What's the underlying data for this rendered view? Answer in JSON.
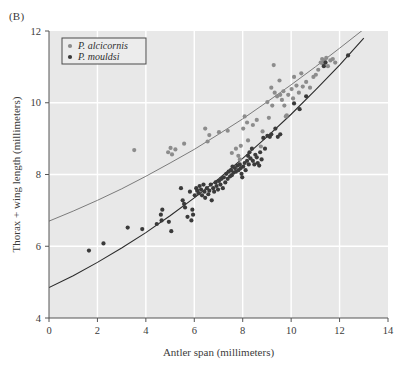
{
  "panel": {
    "label": "(B)"
  },
  "colors": {
    "plot_background": "#e8e8e8",
    "gridline": "#ffffff",
    "axis": "#555555",
    "alcicornis_point": "#8c8c8c",
    "mouldsi_point": "#3a3a3a",
    "alcicornis_curve": "#6e6e6e",
    "mouldsi_curve": "#2b2b2b",
    "legend_background": "#ececec",
    "legend_border": "#4a4a4a",
    "text": "#3b3b3b"
  },
  "legend": {
    "position": "top-left",
    "entries": [
      {
        "label": "P. alcicornis",
        "marker": "dot",
        "color": "#8c8c8c"
      },
      {
        "label": "P. mouldsi",
        "marker": "dot",
        "color": "#3a3a3a"
      }
    ]
  },
  "chart_data": {
    "type": "scatter",
    "title": "",
    "xlabel": "Antler span (millimeters)",
    "ylabel": "Thorax + wing length (millimeters)",
    "xlim": [
      0,
      14
    ],
    "ylim": [
      4,
      12
    ],
    "xticks": [
      0,
      2,
      4,
      6,
      8,
      10,
      12,
      14
    ],
    "yticks": [
      4,
      6,
      8,
      10,
      12
    ],
    "xtick_labels": [
      "0",
      "2",
      "4",
      "6",
      "8",
      "10",
      "12",
      "14"
    ],
    "ytick_labels": [
      "4",
      "6",
      "8",
      "10",
      "12"
    ],
    "grid": true,
    "grid_color": "#ffffff",
    "legend_position": "upper left",
    "series": [
      {
        "name": "P. alcicornis",
        "color": "#8c8c8c",
        "marker": "circle",
        "points": [
          [
            3.52,
            8.68
          ],
          [
            4.92,
            8.62
          ],
          [
            5.02,
            8.74
          ],
          [
            5.08,
            8.56
          ],
          [
            5.22,
            8.7
          ],
          [
            5.58,
            8.86
          ],
          [
            6.45,
            9.28
          ],
          [
            6.55,
            8.92
          ],
          [
            6.62,
            9.1
          ],
          [
            7.02,
            9.18
          ],
          [
            7.38,
            9.22
          ],
          [
            7.55,
            8.6
          ],
          [
            7.72,
            8.72
          ],
          [
            7.82,
            8.52
          ],
          [
            7.88,
            8.42
          ],
          [
            7.92,
            8.8
          ],
          [
            8.02,
            9.28
          ],
          [
            8.08,
            9.62
          ],
          [
            8.18,
            9.45
          ],
          [
            8.22,
            8.95
          ],
          [
            8.42,
            9.38
          ],
          [
            8.58,
            9.52
          ],
          [
            8.75,
            8.78
          ],
          [
            8.82,
            9.2
          ],
          [
            9.02,
            10.02
          ],
          [
            9.08,
            9.58
          ],
          [
            9.18,
            10.42
          ],
          [
            9.22,
            9.92
          ],
          [
            9.28,
            11.05
          ],
          [
            9.32,
            10.28
          ],
          [
            9.42,
            10.18
          ],
          [
            9.52,
            10.62
          ],
          [
            9.55,
            10.22
          ],
          [
            9.62,
            10.08
          ],
          [
            9.68,
            10.32
          ],
          [
            9.72,
            9.92
          ],
          [
            9.78,
            9.62
          ],
          [
            9.82,
            9.65
          ],
          [
            9.88,
            10.22
          ],
          [
            10.02,
            10.38
          ],
          [
            10.08,
            10.12
          ],
          [
            10.12,
            10.72
          ],
          [
            10.22,
            10.48
          ],
          [
            10.32,
            10.28
          ],
          [
            10.42,
            10.82
          ],
          [
            10.48,
            10.45
          ],
          [
            10.62,
            10.58
          ],
          [
            10.78,
            10.42
          ],
          [
            10.92,
            10.72
          ],
          [
            11.02,
            10.78
          ],
          [
            11.12,
            10.92
          ],
          [
            11.22,
            11.12
          ],
          [
            11.28,
            11.22
          ],
          [
            11.32,
            11.08
          ],
          [
            11.38,
            11.18
          ],
          [
            11.45,
            11.25
          ],
          [
            11.52,
            11.02
          ],
          [
            11.62,
            11.18
          ],
          [
            11.72,
            11.22
          ],
          [
            11.82,
            11.12
          ]
        ]
      },
      {
        "name": "P. mouldsi",
        "color": "#3a3a3a",
        "marker": "circle",
        "points": [
          [
            1.65,
            5.88
          ],
          [
            2.25,
            6.08
          ],
          [
            3.25,
            6.52
          ],
          [
            3.85,
            6.48
          ],
          [
            4.45,
            6.62
          ],
          [
            4.62,
            6.88
          ],
          [
            4.65,
            6.72
          ],
          [
            4.68,
            7.02
          ],
          [
            4.95,
            6.68
          ],
          [
            5.05,
            6.42
          ],
          [
            5.45,
            7.62
          ],
          [
            5.52,
            7.28
          ],
          [
            5.58,
            7.18
          ],
          [
            5.62,
            7.08
          ],
          [
            5.72,
            6.82
          ],
          [
            5.82,
            7.52
          ],
          [
            5.88,
            6.72
          ],
          [
            5.92,
            7.02
          ],
          [
            5.95,
            6.88
          ],
          [
            6.02,
            7.42
          ],
          [
            6.08,
            7.62
          ],
          [
            6.12,
            7.55
          ],
          [
            6.18,
            7.48
          ],
          [
            6.22,
            7.68
          ],
          [
            6.28,
            7.58
          ],
          [
            6.32,
            7.42
          ],
          [
            6.38,
            7.72
          ],
          [
            6.42,
            7.52
          ],
          [
            6.45,
            7.35
          ],
          [
            6.52,
            7.62
          ],
          [
            6.58,
            7.45
          ],
          [
            6.62,
            7.55
          ],
          [
            6.68,
            7.72
          ],
          [
            6.72,
            7.28
          ],
          [
            6.78,
            7.62
          ],
          [
            6.82,
            7.52
          ],
          [
            6.88,
            7.78
          ],
          [
            6.92,
            7.68
          ],
          [
            6.98,
            7.58
          ],
          [
            7.02,
            7.82
          ],
          [
            7.08,
            7.72
          ],
          [
            7.12,
            7.88
          ],
          [
            7.18,
            7.62
          ],
          [
            7.22,
            7.92
          ],
          [
            7.28,
            7.78
          ],
          [
            7.32,
            8.02
          ],
          [
            7.38,
            7.88
          ],
          [
            7.42,
            8.08
          ],
          [
            7.48,
            7.95
          ],
          [
            7.52,
            8.12
          ],
          [
            7.55,
            7.98
          ],
          [
            7.58,
            8.22
          ],
          [
            7.62,
            8.05
          ],
          [
            7.68,
            8.18
          ],
          [
            7.72,
            8.08
          ],
          [
            7.78,
            8.25
          ],
          [
            7.82,
            8.12
          ],
          [
            7.88,
            8.28
          ],
          [
            7.92,
            8.18
          ],
          [
            7.95,
            8.02
          ],
          [
            7.98,
            7.92
          ],
          [
            8.02,
            8.22
          ],
          [
            8.08,
            8.32
          ],
          [
            8.12,
            8.12
          ],
          [
            8.18,
            8.38
          ],
          [
            8.22,
            8.52
          ],
          [
            8.25,
            8.28
          ],
          [
            8.28,
            8.62
          ],
          [
            8.32,
            8.45
          ],
          [
            8.38,
            8.72
          ],
          [
            8.42,
            8.38
          ],
          [
            8.48,
            8.28
          ],
          [
            8.52,
            8.55
          ],
          [
            8.58,
            8.48
          ],
          [
            8.62,
            8.32
          ],
          [
            8.68,
            8.25
          ],
          [
            8.72,
            8.62
          ],
          [
            8.78,
            8.42
          ],
          [
            8.85,
            9.02
          ],
          [
            8.92,
            8.72
          ],
          [
            9.02,
            9.08
          ],
          [
            9.12,
            9.05
          ],
          [
            9.18,
            9.12
          ],
          [
            9.35,
            9.28
          ],
          [
            9.45,
            9.05
          ],
          [
            9.55,
            9.12
          ],
          [
            10.12,
            9.98
          ],
          [
            10.35,
            9.82
          ],
          [
            10.62,
            10.18
          ],
          [
            11.35,
            11.02
          ],
          [
            11.42,
            11.12
          ],
          [
            12.35,
            11.32
          ]
        ]
      }
    ],
    "fitted_curves": [
      {
        "name": "P. alcicornis fit",
        "color": "#6e6e6e",
        "description": "upper convex curve from (0, 6.70) rising to (13.6, 12.0)",
        "y_at_x0": 6.7,
        "points": [
          [
            0,
            6.7
          ],
          [
            1,
            6.98
          ],
          [
            2,
            7.28
          ],
          [
            3,
            7.6
          ],
          [
            4,
            7.95
          ],
          [
            5,
            8.32
          ],
          [
            6,
            8.7
          ],
          [
            7,
            9.12
          ],
          [
            8,
            9.55
          ],
          [
            9,
            10.02
          ],
          [
            10,
            10.5
          ],
          [
            11,
            11.0
          ],
          [
            12,
            11.52
          ],
          [
            13,
            12.05
          ]
        ]
      },
      {
        "name": "P. mouldsi fit",
        "color": "#2b2b2b",
        "description": "lower convex curve from (0, 4.85) rising to (13.2, 12.0)",
        "y_at_x0": 4.85,
        "points": [
          [
            0,
            4.85
          ],
          [
            1,
            5.18
          ],
          [
            2,
            5.55
          ],
          [
            3,
            5.95
          ],
          [
            4,
            6.38
          ],
          [
            5,
            6.85
          ],
          [
            6,
            7.35
          ],
          [
            7,
            7.88
          ],
          [
            8,
            8.45
          ],
          [
            9,
            9.05
          ],
          [
            10,
            9.68
          ],
          [
            11,
            10.35
          ],
          [
            12,
            11.05
          ],
          [
            13,
            11.8
          ]
        ]
      }
    ]
  }
}
